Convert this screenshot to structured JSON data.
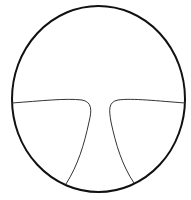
{
  "diagram": {
    "type": "divided-circle",
    "colors": {
      "background": "#ffffff",
      "outline": "#111111",
      "divider": "#333333"
    },
    "outline": {
      "cx": 98.5,
      "cy": 99,
      "rx": 86.5,
      "ry": 93,
      "stroke_width": 2
    },
    "regions": [
      {
        "id": "top",
        "label": ""
      },
      {
        "id": "bottom-left",
        "label": ""
      },
      {
        "id": "bottom-right",
        "label": ""
      },
      {
        "id": "center-channel",
        "label": ""
      }
    ],
    "dividers": [
      {
        "id": "left-divider",
        "path": "M12,103 C40,101 66,98 82,100 C92,102 92,110 89,122 C84,145 78,165 66,184",
        "stroke_width": 1
      },
      {
        "id": "right-divider",
        "path": "M185,103 C158,101 132,98 118,100 C108,102 109,110 111,122 C116,145 122,165 134,183",
        "stroke_width": 1
      }
    ]
  }
}
